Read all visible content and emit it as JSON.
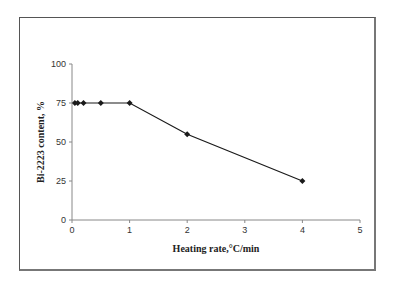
{
  "chart_data": {
    "type": "line",
    "title": "",
    "xlabel": "Heating rate,°C/min",
    "ylabel": "Bi-2223 content, %",
    "xlim": [
      0,
      5
    ],
    "ylim": [
      0,
      100
    ],
    "x_ticks": [
      "0",
      "1",
      "2",
      "3",
      "4",
      "5"
    ],
    "y_ticks": [
      "0",
      "25",
      "50",
      "75",
      "100"
    ],
    "grid": false,
    "legend": null,
    "series": [
      {
        "name": "Bi-2223 content",
        "marker": "diamond",
        "color": "#1a1a1a",
        "x": [
          0.05,
          0.1,
          0.2,
          0.5,
          1,
          2,
          4
        ],
        "values": [
          75,
          75,
          75,
          75,
          75,
          55,
          25
        ]
      }
    ]
  }
}
